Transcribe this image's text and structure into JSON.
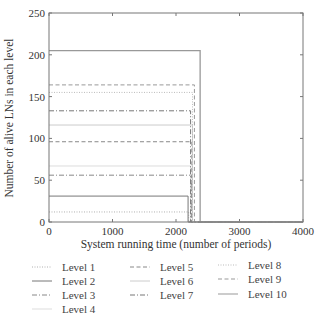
{
  "chart_data": {
    "type": "line",
    "title": "",
    "xlabel": "System running time (number of periods)",
    "ylabel": "Number of alive LNs in each level",
    "xlim": [
      0,
      4000
    ],
    "ylim": [
      0,
      250
    ],
    "xticks": [
      0,
      1000,
      2000,
      3000,
      4000
    ],
    "yticks": [
      0,
      50,
      100,
      150,
      200,
      250
    ],
    "grid": false,
    "legend_position": "below",
    "series": [
      {
        "name": "Level 1",
        "style": "dotted",
        "color": "#b0b0b0",
        "value": 12,
        "drop_at": 2200,
        "x": [
          0,
          2200,
          2200,
          4000
        ],
        "y": [
          12,
          12,
          0,
          0
        ]
      },
      {
        "name": "Level 2",
        "style": "solid",
        "color": "#777777",
        "value": 31,
        "drop_at": 2190,
        "x": [
          0,
          2190,
          2190,
          4000
        ],
        "y": [
          31,
          31,
          0,
          0
        ]
      },
      {
        "name": "Level 3",
        "style": "dashdot",
        "color": "#888888",
        "value": 56,
        "drop_at": 2240,
        "x": [
          0,
          2240,
          2240,
          4000
        ],
        "y": [
          56,
          56,
          0,
          0
        ]
      },
      {
        "name": "Level 4",
        "style": "solid",
        "color": "#dddddd",
        "value": 67,
        "drop_at": 2230,
        "x": [
          0,
          2230,
          2230,
          4000
        ],
        "y": [
          67,
          67,
          0,
          0
        ]
      },
      {
        "name": "Level 5",
        "style": "dashed",
        "color": "#888888",
        "value": 96,
        "drop_at": 2250,
        "x": [
          0,
          2250,
          2250,
          4000
        ],
        "y": [
          96,
          96,
          0,
          0
        ]
      },
      {
        "name": "Level 6",
        "style": "solid",
        "color": "#cccccc",
        "value": 116,
        "drop_at": 2260,
        "x": [
          0,
          2260,
          2260,
          4000
        ],
        "y": [
          116,
          116,
          0,
          0
        ]
      },
      {
        "name": "Level 7",
        "style": "dashdot",
        "color": "#777777",
        "value": 133,
        "drop_at": 2230,
        "x": [
          0,
          2230,
          2230,
          4000
        ],
        "y": [
          133,
          133,
          0,
          0
        ]
      },
      {
        "name": "Level 8",
        "style": "dotted",
        "color": "#bbbbbb",
        "value": 155,
        "drop_at": 2260,
        "x": [
          0,
          2260,
          2260,
          4000
        ],
        "y": [
          155,
          155,
          0,
          0
        ]
      },
      {
        "name": "Level 9",
        "style": "dashed",
        "color": "#999999",
        "value": 164,
        "drop_at": 2290,
        "x": [
          0,
          2290,
          2290,
          4000
        ],
        "y": [
          164,
          164,
          0,
          0
        ]
      },
      {
        "name": "Level 10",
        "style": "solid",
        "color": "#999999",
        "value": 205,
        "drop_at": 2380,
        "x": [
          0,
          2380,
          2380,
          4000
        ],
        "y": [
          205,
          205,
          0,
          0
        ]
      }
    ]
  },
  "legend": {
    "items": [
      {
        "label": "Level 1"
      },
      {
        "label": "Level 2"
      },
      {
        "label": "Level 3"
      },
      {
        "label": "Level 4"
      },
      {
        "label": "Level 5"
      },
      {
        "label": "Level 6"
      },
      {
        "label": "Level 7"
      },
      {
        "label": "Level 8"
      },
      {
        "label": "Level 9"
      },
      {
        "label": "Level 10"
      }
    ]
  }
}
